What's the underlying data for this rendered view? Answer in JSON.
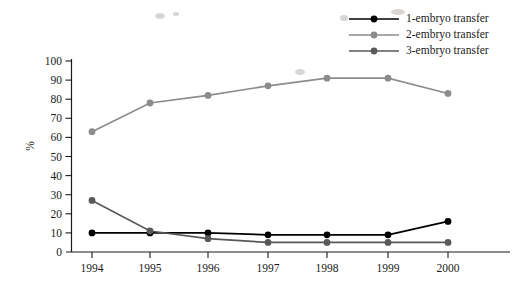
{
  "chart_data": {
    "type": "line",
    "title": "",
    "subtitle": "",
    "xlabel": "",
    "ylabel": "%",
    "categories": [
      "1994",
      "1995",
      "1996",
      "1997",
      "1998",
      "1999",
      "2000"
    ],
    "x": [
      1994,
      1995,
      1996,
      1997,
      1998,
      1999,
      2000
    ],
    "xlim": [
      1994,
      2000
    ],
    "ylim": [
      0,
      100
    ],
    "y_ticks": [
      0,
      10,
      20,
      30,
      40,
      50,
      60,
      70,
      80,
      90,
      100
    ],
    "grid": false,
    "legend_position": "top-right",
    "series": [
      {
        "name": "1-embryo transfer",
        "color": "#000000",
        "marker": "circle",
        "values": [
          10,
          10,
          10,
          9,
          9,
          9,
          16
        ]
      },
      {
        "name": "2-embryo transfer",
        "color": "#8c8c8c",
        "marker": "circle",
        "values": [
          63,
          78,
          82,
          87,
          91,
          91,
          83
        ]
      },
      {
        "name": "3-embryo transfer",
        "color": "#595959",
        "marker": "circle",
        "values": [
          27,
          11,
          7,
          5,
          5,
          5,
          5
        ]
      }
    ]
  },
  "axis": {
    "y_title": "%",
    "y_tick_labels": [
      "100",
      "90",
      "80",
      "70",
      "60",
      "50",
      "40",
      "30",
      "20",
      "10",
      "0"
    ],
    "x_tick_labels": [
      "1994",
      "1995",
      "1996",
      "1997",
      "1998",
      "1999",
      "2000"
    ]
  },
  "legend": {
    "items": [
      {
        "label": "1-embryo transfer",
        "color": "#000000"
      },
      {
        "label": "2-embryo transfer",
        "color": "#8c8c8c"
      },
      {
        "label": "3-embryo transfer",
        "color": "#595959"
      }
    ]
  }
}
